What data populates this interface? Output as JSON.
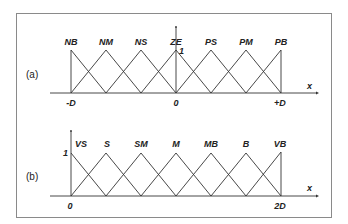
{
  "panels": [
    {
      "id": "a",
      "label": "(a)",
      "sets": [
        "NB",
        "NM",
        "NS",
        "ZE",
        "PS",
        "PM",
        "PB"
      ],
      "x_ticks": [
        "-D",
        "0",
        "+D"
      ],
      "x_axis_label": "x",
      "y_tick": "1"
    },
    {
      "id": "b",
      "label": "(b)",
      "sets": [
        "VS",
        "S",
        "SM",
        "M",
        "MB",
        "B",
        "VB"
      ],
      "x_ticks": [
        "0",
        "2D"
      ],
      "x_axis_label": "x",
      "y_tick": "1"
    }
  ],
  "colors": {
    "line": "#333333",
    "frame": "#8a8a8a",
    "text": "#222222"
  }
}
